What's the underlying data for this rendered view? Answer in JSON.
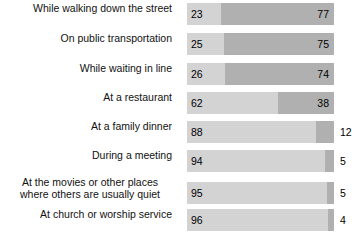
{
  "chart_data": {
    "type": "bar",
    "subtype": "horizontal-stacked-100",
    "title": "",
    "subtitle": "",
    "xlabel": "",
    "ylabel": "",
    "xlim": [
      0,
      100
    ],
    "grid": false,
    "legend_position": "none",
    "units": "percent",
    "colors": {
      "segment_left": "#d3d3d3",
      "segment_right": "#b0b0b0",
      "background": "#ffffff",
      "text": "#000000"
    },
    "categories": [
      "While walking down the street",
      "On public transportation",
      "While waiting in line",
      "At a restaurant",
      "At a family dinner",
      "During a meeting",
      "At the movies or other places where others are usually quiet",
      "At church or worship service"
    ],
    "series": [
      {
        "name": "left",
        "values": [
          23,
          25,
          26,
          62,
          88,
          94,
          95,
          96
        ]
      },
      {
        "name": "right",
        "values": [
          77,
          75,
          74,
          38,
          12,
          5,
          5,
          4
        ]
      }
    ]
  },
  "rows": [
    {
      "label": "While walking down the street",
      "label_lines": [
        "While walking down the street"
      ],
      "left_value": "23",
      "right_value": "77",
      "left_pct": 23,
      "right_pct": 77,
      "right_label_outside": false
    },
    {
      "label": "On public transportation",
      "label_lines": [
        "On public transportation"
      ],
      "left_value": "25",
      "right_value": "75",
      "left_pct": 25,
      "right_pct": 75,
      "right_label_outside": false
    },
    {
      "label": "While waiting in line",
      "label_lines": [
        "While waiting in line"
      ],
      "left_value": "26",
      "right_value": "74",
      "left_pct": 26,
      "right_pct": 74,
      "right_label_outside": false
    },
    {
      "label": "At a restaurant",
      "label_lines": [
        "At a restaurant"
      ],
      "left_value": "62",
      "right_value": "38",
      "left_pct": 62,
      "right_pct": 38,
      "right_label_outside": false
    },
    {
      "label": "At a family dinner",
      "label_lines": [
        "At a family dinner"
      ],
      "left_value": "88",
      "right_value": "12",
      "left_pct": 88,
      "right_pct": 12,
      "right_label_outside": true
    },
    {
      "label": "During a meeting",
      "label_lines": [
        "During a meeting"
      ],
      "left_value": "94",
      "right_value": "5",
      "left_pct": 94,
      "right_pct": 6,
      "right_label_outside": true
    },
    {
      "label": "At the movies or other places where others are usually quiet",
      "label_lines": [
        "At the movies or other places",
        "where others are usually quiet"
      ],
      "left_value": "95",
      "right_value": "5",
      "left_pct": 95,
      "right_pct": 5,
      "right_label_outside": true
    },
    {
      "label": "At church or worship service",
      "label_lines": [
        "At church or worship service"
      ],
      "left_value": "96",
      "right_value": "4",
      "left_pct": 96,
      "right_pct": 4,
      "right_label_outside": true
    }
  ]
}
